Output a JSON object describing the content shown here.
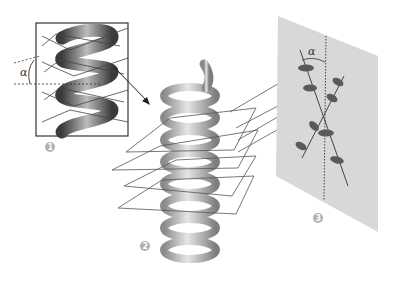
{
  "figure": {
    "labels": {
      "step1": "1",
      "step2": "2",
      "step3": "3",
      "angle_symbol_inset": "α",
      "angle_symbol_film": "α"
    },
    "panels": [
      {
        "id": "inset",
        "description": "Close-up of helix with cross-section planes and tilt angle α"
      },
      {
        "id": "helix",
        "description": "3D helical coil sliced by parallel inclined planes"
      },
      {
        "id": "film",
        "description": "Projection screen showing X-shaped diffraction spot pattern with angle α"
      }
    ],
    "colors": {
      "helix": "#a8a8a8",
      "helix_highlight": "#e0e0e0",
      "lines": "#555555",
      "film": "#d6d6d6",
      "spots": "#5a5a5a",
      "label_circle": "#b0b0b0"
    }
  }
}
